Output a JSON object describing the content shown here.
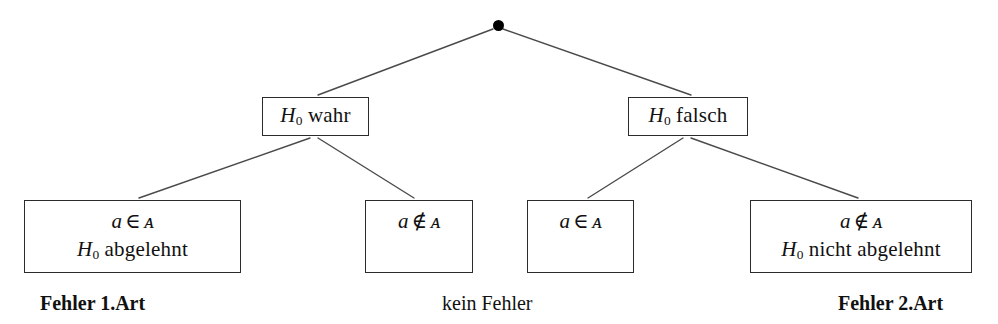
{
  "diagram": {
    "title_text": "",
    "root": {
      "name": "root-node-dot",
      "x": 498,
      "y": 25,
      "radius": 5.5,
      "color": "#000000"
    },
    "line_color": "#4a4a4a",
    "box_border_color": "#2b2b2b",
    "background": "#ffffff",
    "level1": [
      {
        "id": "h0-true",
        "label_plain": "H0 wahr",
        "symbol": "H",
        "subscript": "0",
        "word": "wahr",
        "x": 262,
        "y": 97,
        "w": 107,
        "h": 39
      },
      {
        "id": "h0-false",
        "label_plain": "H0 falsch",
        "symbol": "H",
        "subscript": "0",
        "word": "falsch",
        "x": 628,
        "y": 97,
        "w": 120,
        "h": 39
      }
    ],
    "leaves": [
      {
        "id": "leaf-a-in-A-rejected",
        "line1_plain": "a ∈ 𝒜",
        "line1": {
          "var": "a",
          "op": "∈",
          "set": "ᴀ"
        },
        "line2_plain": "H0 abgelehnt",
        "line2": {
          "symbol": "H",
          "subscript": "0",
          "word": "abgelehnt"
        },
        "x": 24,
        "y": 200,
        "w": 217,
        "h": 73
      },
      {
        "id": "leaf-a-notin-A",
        "line1_plain": "a ∉ 𝒜",
        "line1": {
          "var": "a",
          "op": "∉",
          "set": "ᴀ"
        },
        "line2_plain": "",
        "x": 365,
        "y": 200,
        "w": 108,
        "h": 73
      },
      {
        "id": "leaf-a-in-A",
        "line1_plain": "a ∈ 𝒜",
        "line1": {
          "var": "a",
          "op": "∈",
          "set": "ᴀ"
        },
        "line2_plain": "",
        "x": 527,
        "y": 200,
        "w": 107,
        "h": 73
      },
      {
        "id": "leaf-a-notin-A-not-rejected",
        "line1_plain": "a ∉ 𝒜",
        "line1": {
          "var": "a",
          "op": "∉",
          "set": "ᴀ"
        },
        "line2_plain": "H0 nicht abgelehnt",
        "line2": {
          "symbol": "H",
          "subscript": "0",
          "word": "nicht abgelehnt"
        },
        "x": 750,
        "y": 200,
        "w": 222,
        "h": 73
      }
    ],
    "captions": [
      {
        "id": "caption-type-1-error",
        "text": "Fehler 1.Art",
        "x": 40,
        "y": 292,
        "bold": true
      },
      {
        "id": "caption-no-error",
        "text": "kein Fehler",
        "x": 442,
        "y": 292,
        "bold": false
      },
      {
        "id": "caption-type-2-error",
        "text": "Fehler 2.Art",
        "x": 838,
        "y": 292,
        "bold": true
      }
    ],
    "edges": [
      {
        "id": "edge-root-to-h0-true",
        "x1": 493,
        "y1": 29,
        "x2": 318,
        "y2": 95
      },
      {
        "id": "edge-root-to-h0-false",
        "x1": 503,
        "y1": 29,
        "x2": 691,
        "y2": 95
      },
      {
        "id": "edge-h0-true-to-leaf1",
        "x1": 310,
        "y1": 138,
        "x2": 139,
        "y2": 198
      },
      {
        "id": "edge-h0-true-to-leaf2",
        "x1": 318,
        "y1": 138,
        "x2": 414,
        "y2": 198
      },
      {
        "id": "edge-h0-false-to-leaf3",
        "x1": 683,
        "y1": 138,
        "x2": 588,
        "y2": 198
      },
      {
        "id": "edge-h0-false-to-leaf4",
        "x1": 691,
        "y1": 138,
        "x2": 858,
        "y2": 198
      }
    ]
  }
}
